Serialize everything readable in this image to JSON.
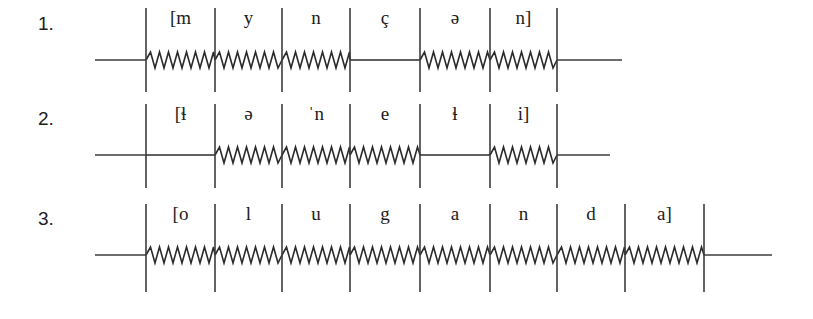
{
  "figure": {
    "background_color": "#ffffff",
    "line_color": "#2b2b2b",
    "text_color": "#1c1c1c",
    "wave_period_px": 9,
    "wave_amplitude_px": 8
  },
  "rows": [
    {
      "number": "1.",
      "number_x": 38,
      "baseline_y": 60,
      "tick_top": 8,
      "tick_bottom": 92,
      "label_y": 24,
      "lead_in_start": 95,
      "tail_end": 622,
      "ticks": [
        146,
        215,
        282,
        350,
        420,
        490,
        557
      ],
      "segments": [
        {
          "label": "[m",
          "x_start": 146,
          "x_end": 215,
          "voiced": true
        },
        {
          "label": "y",
          "x_start": 215,
          "x_end": 282,
          "voiced": true
        },
        {
          "label": "n",
          "x_start": 282,
          "x_end": 350,
          "voiced": true
        },
        {
          "label": "ç",
          "x_start": 350,
          "x_end": 420,
          "voiced": false
        },
        {
          "label": "ə",
          "x_start": 420,
          "x_end": 490,
          "voiced": true
        },
        {
          "label": "n]",
          "x_start": 490,
          "x_end": 557,
          "voiced": true
        }
      ]
    },
    {
      "number": "2.",
      "number_x": 38,
      "baseline_y": 155,
      "tick_top": 104,
      "tick_bottom": 188,
      "label_y": 120,
      "lead_in_start": 95,
      "tail_end": 610,
      "ticks": [
        146,
        215,
        282,
        350,
        420,
        490,
        557
      ],
      "segments": [
        {
          "label": "[ɬ",
          "x_start": 146,
          "x_end": 215,
          "voiced": false
        },
        {
          "label": "ə",
          "x_start": 215,
          "x_end": 282,
          "voiced": true
        },
        {
          "label": "ˈn",
          "x_start": 282,
          "x_end": 350,
          "voiced": true
        },
        {
          "label": "e",
          "x_start": 350,
          "x_end": 420,
          "voiced": true
        },
        {
          "label": "ɬ",
          "x_start": 420,
          "x_end": 490,
          "voiced": false
        },
        {
          "label": "i]",
          "x_start": 490,
          "x_end": 557,
          "voiced": true
        }
      ]
    },
    {
      "number": "3.",
      "number_x": 38,
      "baseline_y": 255,
      "tick_top": 204,
      "tick_bottom": 292,
      "label_y": 220,
      "lead_in_start": 95,
      "tail_end": 772,
      "ticks": [
        146,
        215,
        282,
        350,
        420,
        490,
        557,
        625,
        704
      ],
      "segments": [
        {
          "label": "[o",
          "x_start": 146,
          "x_end": 215,
          "voiced": true
        },
        {
          "label": "l",
          "x_start": 215,
          "x_end": 282,
          "voiced": true
        },
        {
          "label": "u",
          "x_start": 282,
          "x_end": 350,
          "voiced": true
        },
        {
          "label": "g",
          "x_start": 350,
          "x_end": 420,
          "voiced": true
        },
        {
          "label": "a",
          "x_start": 420,
          "x_end": 490,
          "voiced": true
        },
        {
          "label": "n",
          "x_start": 490,
          "x_end": 557,
          "voiced": true
        },
        {
          "label": "d",
          "x_start": 557,
          "x_end": 625,
          "voiced": true
        },
        {
          "label": "a]",
          "x_start": 625,
          "x_end": 704,
          "voiced": true
        }
      ]
    }
  ]
}
